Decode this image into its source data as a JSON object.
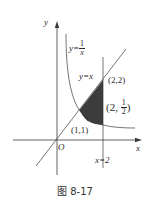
{
  "figure": {
    "caption": "图 8-17",
    "axes": {
      "x_label": "x",
      "y_label": "y",
      "origin_label": "O"
    },
    "curves": {
      "hyperbola_label_lhs": "y=",
      "hyperbola_frac_num": "1",
      "hyperbola_frac_den": "x",
      "line_label": "y=x",
      "vertical_line_label": "x=2"
    },
    "points": {
      "p11": "(1,1)",
      "p22": "(2,2)",
      "p2half_open": "(2, ",
      "p2half_num": "1",
      "p2half_den": "2",
      "p2half_close": ")"
    },
    "colors": {
      "stroke": "#3a3a3a",
      "shade": "#3c3c3c"
    }
  }
}
